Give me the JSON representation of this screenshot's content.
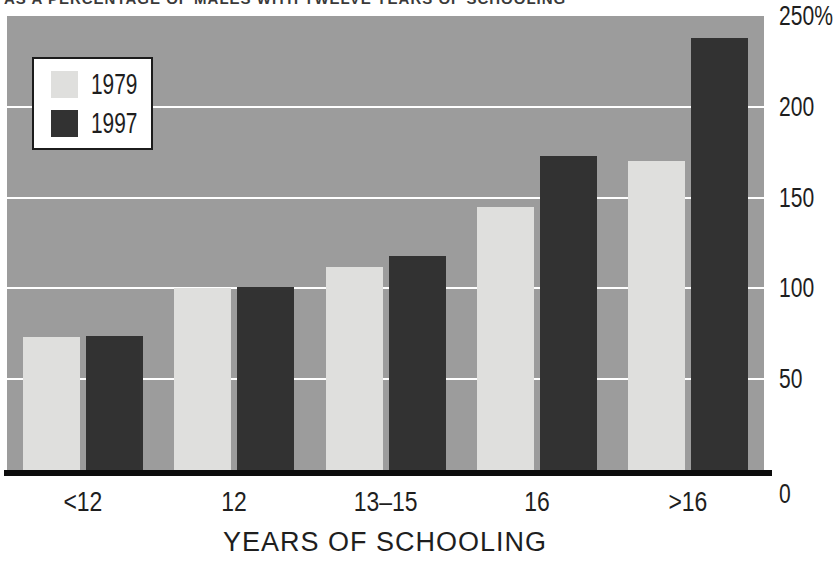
{
  "figure": {
    "clipped_title": "AS A PERCENTAGE OF MALES WITH TWELVE YEARS OF SCHOOLING",
    "x_axis_title": "YEARS OF SCHOOLING"
  },
  "chart_data": {
    "type": "bar",
    "title": "AS A PERCENTAGE OF MALES WITH TWELVE YEARS OF SCHOOLING",
    "xlabel": "YEARS OF SCHOOLING",
    "ylabel": "",
    "categories": [
      "<12",
      "12",
      "13–15",
      "16",
      ">16"
    ],
    "series": [
      {
        "name": "1979",
        "color": "#dfdfdd",
        "values": [
          73,
          100,
          112,
          145,
          170
        ]
      },
      {
        "name": "1997",
        "color": "#323232",
        "values": [
          74,
          101,
          118,
          173,
          238
        ]
      }
    ],
    "ylim": [
      0,
      250
    ],
    "y_ticks": [
      {
        "value": 0,
        "label": "0"
      },
      {
        "value": 50,
        "label": "50"
      },
      {
        "value": 100,
        "label": "100"
      },
      {
        "value": 150,
        "label": "150"
      },
      {
        "value": 200,
        "label": "200"
      },
      {
        "value": 250,
        "label": "250%"
      }
    ],
    "gridlines": [
      50,
      100,
      150,
      200
    ],
    "grid_on": true,
    "grid_color": "#ffffff",
    "plot_background": "#9c9c9c",
    "axis_line_color": "#0c0c0c",
    "legend_position": "top-left"
  }
}
